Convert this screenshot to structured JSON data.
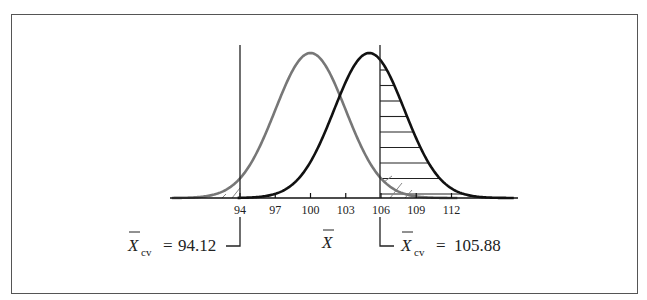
{
  "figure": {
    "type": "two-normal-curves-hypothesis-test",
    "axis_label": "X",
    "axis_label_bar": true,
    "ticks": [
      "94",
      "97",
      "100",
      "103",
      "106",
      "109",
      "112"
    ],
    "left_critical": {
      "symbol": "X",
      "subscript": "cv",
      "equals": "=",
      "value": "94.12"
    },
    "right_critical": {
      "symbol": "X",
      "subscript": "cv",
      "equals": "=",
      "value": "105.88"
    },
    "curves": [
      {
        "name": "null-distribution",
        "mean": 100,
        "sd": 3,
        "color": "#777777"
      },
      {
        "name": "alternative-distribution",
        "mean": 105,
        "sd": 3,
        "color": "#111111"
      }
    ],
    "critical_values": [
      94.12,
      105.88
    ],
    "shading": "horizontal hatching under alternative curve right of 105.88; diagonal hatching in null tails beyond critical values"
  }
}
